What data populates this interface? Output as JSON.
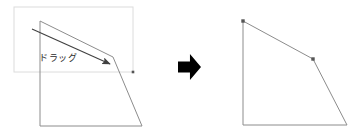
{
  "canvas": {
    "width": 360,
    "height": 137,
    "background": "#ffffff"
  },
  "colors": {
    "shape_stroke": "#8c8c8c",
    "selection_stroke": "#dcdcdc",
    "drag_arrow": "#404040",
    "big_arrow": "#000000",
    "label_text": "#2b2b2b",
    "handle_fill": "#555555"
  },
  "left_panel": {
    "name": "before-state",
    "selection_box": {
      "x": 14,
      "y": 7,
      "width": 119,
      "height": 65,
      "stroke": "#dcdcdc"
    },
    "shape": {
      "type": "polygon",
      "points": "40,21 113,57 142,126 40,126",
      "stroke": "#8c8c8c",
      "fill": "none"
    },
    "drag_arrow": {
      "x1": 32,
      "y1": 29,
      "x2": 112,
      "y2": 65,
      "stroke": "#404040"
    },
    "drag_label": "ドラッグ",
    "handle": {
      "x": 133,
      "y": 72
    }
  },
  "transition": {
    "name": "result-arrow",
    "glyph": "right-arrow",
    "x": 178,
    "y": 54,
    "width": 23,
    "height": 26,
    "fill": "#000000"
  },
  "right_panel": {
    "name": "after-state",
    "shape": {
      "type": "polygon",
      "points": "243,21 313,59 347,125 243,125",
      "stroke": "#8c8c8c",
      "fill": "none"
    },
    "vertex_handles": [
      {
        "x": 243,
        "y": 21
      },
      {
        "x": 313,
        "y": 59
      }
    ]
  }
}
